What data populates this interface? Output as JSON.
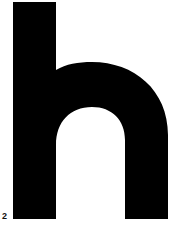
{
  "figure": {
    "glyph": "h",
    "glyph_color": "#000000",
    "background": "#ffffff",
    "label": "2"
  }
}
